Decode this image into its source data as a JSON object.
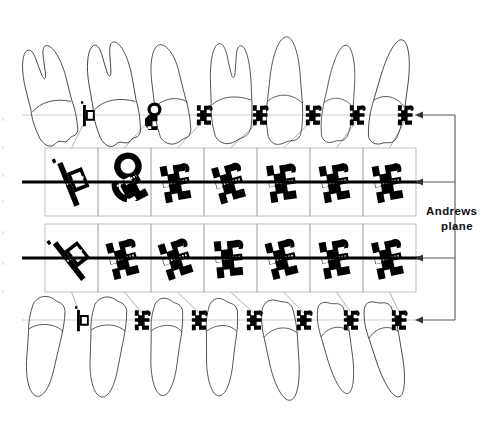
{
  "figure": {
    "background_color": "#ffffff",
    "ink_color": "#000000",
    "outline_color": "#3b3b3b",
    "grid_color": "#b9b9b9",
    "guide_color": "#cfcfcf",
    "connector_color": "#a8a8a8"
  },
  "annotations": {
    "andrews_plane_line1": "Andrews",
    "andrews_plane_line2": "plane"
  },
  "planes": {
    "upper_tooth_plane_y": 115,
    "upper_bracket_plane_y": 182,
    "lower_bracket_plane_y": 258,
    "lower_tooth_plane_y": 320
  },
  "arrows": {
    "count": 4,
    "direction": "left",
    "bus_x": 455,
    "targets_y": [
      115,
      182,
      258,
      320
    ],
    "tip_x": 415
  },
  "grid": {
    "columns": 7,
    "rows": 2,
    "cell_width": 53,
    "cell_height": 68,
    "x_start": 45,
    "row1_y": 148,
    "row2_y": 224,
    "cells": [
      {
        "row": 1,
        "col": 1,
        "type": "molar-tube",
        "tooth": "upper-second-molar"
      },
      {
        "row": 1,
        "col": 2,
        "type": "molar-tube-headgear",
        "tooth": "upper-first-molar"
      },
      {
        "row": 1,
        "col": 3,
        "type": "twin-bracket",
        "tooth": "upper-second-premolar"
      },
      {
        "row": 1,
        "col": 4,
        "type": "twin-bracket",
        "tooth": "upper-first-premolar"
      },
      {
        "row": 1,
        "col": 5,
        "type": "twin-bracket",
        "tooth": "upper-canine"
      },
      {
        "row": 1,
        "col": 6,
        "type": "twin-bracket",
        "tooth": "upper-lateral-incisor"
      },
      {
        "row": 1,
        "col": 7,
        "type": "twin-bracket",
        "tooth": "upper-central-incisor"
      },
      {
        "row": 2,
        "col": 1,
        "type": "molar-tube",
        "tooth": "lower-second-molar"
      },
      {
        "row": 2,
        "col": 2,
        "type": "twin-bracket",
        "tooth": "lower-first-molar"
      },
      {
        "row": 2,
        "col": 3,
        "type": "twin-bracket",
        "tooth": "lower-second-premolar"
      },
      {
        "row": 2,
        "col": 4,
        "type": "twin-bracket",
        "tooth": "lower-first-premolar"
      },
      {
        "row": 2,
        "col": 5,
        "type": "twin-bracket",
        "tooth": "lower-canine"
      },
      {
        "row": 2,
        "col": 6,
        "type": "twin-bracket",
        "tooth": "lower-lateral-incisor"
      },
      {
        "row": 2,
        "col": 7,
        "type": "twin-bracket",
        "tooth": "lower-central-incisor"
      }
    ]
  },
  "upper_teeth": [
    {
      "index": 1,
      "name": "upper-second-molar",
      "cx": 62,
      "bracket_x": 86,
      "shape": "molar",
      "tip": -14,
      "scale": 1.0
    },
    {
      "index": 2,
      "name": "upper-first-molar",
      "cx": 125,
      "bracket_x": 150,
      "shape": "molar",
      "tip": -10,
      "scale": 1.04
    },
    {
      "index": 3,
      "name": "upper-second-premolar",
      "cx": 180,
      "bracket_x": 205,
      "shape": "premolar",
      "tip": -7,
      "scale": 1.0
    },
    {
      "index": 4,
      "name": "upper-first-premolar",
      "cx": 236,
      "bracket_x": 261,
      "shape": "premolar2",
      "tip": -4,
      "scale": 1.0
    },
    {
      "index": 5,
      "name": "upper-canine",
      "cx": 289,
      "bracket_x": 314,
      "shape": "canine",
      "tip": 2,
      "scale": 1.0
    },
    {
      "index": 6,
      "name": "upper-lateral-incisor",
      "cx": 340,
      "bracket_x": 358,
      "shape": "incisor",
      "tip": 8,
      "scale": 0.92
    },
    {
      "index": 7,
      "name": "upper-central-incisor",
      "cx": 390,
      "bracket_x": 406,
      "shape": "incisor",
      "tip": 12,
      "scale": 1.0
    }
  ],
  "lower_teeth": [
    {
      "index": 1,
      "name": "lower-second-molar",
      "cx": 60,
      "bracket_x": 80,
      "shape": "lmolar",
      "tip": 6,
      "scale": 1.0
    },
    {
      "index": 2,
      "name": "lower-first-molar",
      "cx": 122,
      "bracket_x": 143,
      "shape": "lmolar",
      "tip": 4,
      "scale": 1.0
    },
    {
      "index": 3,
      "name": "lower-second-premolar",
      "cx": 178,
      "bracket_x": 200,
      "shape": "lpremolar",
      "tip": 3,
      "scale": 1.0
    },
    {
      "index": 4,
      "name": "lower-first-premolar",
      "cx": 233,
      "bracket_x": 255,
      "shape": "lpremolar",
      "tip": 2,
      "scale": 1.0
    },
    {
      "index": 5,
      "name": "lower-canine",
      "cx": 286,
      "bracket_x": 305,
      "shape": "lcanine",
      "tip": -8,
      "scale": 1.0
    },
    {
      "index": 6,
      "name": "lower-lateral-incisor",
      "cx": 337,
      "bracket_x": 352,
      "shape": "lincisor",
      "tip": -12,
      "scale": 0.95
    },
    {
      "index": 7,
      "name": "lower-central-incisor",
      "cx": 385,
      "bracket_x": 400,
      "shape": "lincisor",
      "tip": -14,
      "scale": 1.0
    }
  ],
  "archwire": {
    "row1": {
      "x1": 22,
      "x2": 420,
      "y": 182,
      "stroke_width": 3.2
    },
    "row2": {
      "x1": 22,
      "x2": 420,
      "y": 258,
      "stroke_width": 3.2
    }
  },
  "slot_marks": {
    "color": "#ffffff",
    "description": "dotted white archwire slot inside each bracket"
  }
}
